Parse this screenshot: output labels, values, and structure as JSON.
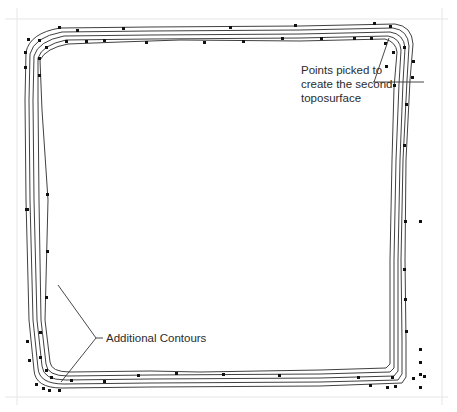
{
  "figure": {
    "colors": {
      "line": "#2a2a2a",
      "point": "#111111",
      "guide": "#e6e6e6",
      "text": "#2b2b2b",
      "background": "#ffffff"
    }
  },
  "annotations": {
    "points_callout": {
      "lines": [
        "Points picked to",
        "create the second",
        "toposurface"
      ]
    },
    "contours_callout": {
      "text": "Additional Contours"
    }
  },
  "contours": {
    "count": 5,
    "offsets": [
      0,
      4,
      8,
      12,
      16
    ]
  }
}
